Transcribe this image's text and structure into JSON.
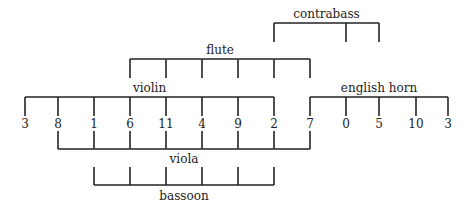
{
  "diagram": {
    "type": "pitch-class row with instrument groupings",
    "row": {
      "numbers": [
        "3",
        "8",
        "1",
        "6",
        "11",
        "4",
        "9",
        "2",
        "7",
        "0",
        "5",
        "10",
        "3"
      ],
      "x": [
        25,
        58,
        94,
        130,
        166,
        202,
        238,
        274,
        310,
        346,
        379,
        416,
        448
      ]
    },
    "groups": [
      {
        "name": "contrabass",
        "label": "contrabass",
        "position": "above",
        "start": 7,
        "end": 9,
        "ticks": [
          7,
          9,
          10
        ],
        "line_y": 23,
        "tick_y": 42,
        "label_y": 18
      },
      {
        "name": "flute",
        "label": "flute",
        "position": "above",
        "start": 3,
        "end": 8,
        "ticks": [
          3,
          4,
          5,
          6,
          7,
          8
        ],
        "line_y": 59,
        "tick_y": 78,
        "label_y": 54
      },
      {
        "name": "violin",
        "label": "violin",
        "position": "above",
        "start": 0,
        "end": 7,
        "ticks": [
          0,
          1,
          2,
          3,
          4,
          5,
          6,
          7
        ],
        "line_y": 97,
        "tick_y": 116,
        "label_y": 92
      },
      {
        "name": "english-horn",
        "label": "english horn",
        "position": "above",
        "start": 8,
        "end": 12,
        "ticks": [
          8,
          9,
          10,
          11,
          12
        ],
        "line_y": 97,
        "tick_y": 116,
        "label_y": 92
      },
      {
        "name": "viola",
        "label": "viola",
        "position": "below",
        "start": 1,
        "end": 8,
        "ticks": [
          1,
          2,
          3,
          4,
          5,
          6,
          7,
          8
        ],
        "line_y": 149,
        "tick_y": 131,
        "label_y": 163
      },
      {
        "name": "bassoon",
        "label": "bassoon",
        "position": "below",
        "start": 2,
        "end": 7,
        "ticks": [
          2,
          3,
          4,
          5,
          6,
          7
        ],
        "line_y": 185,
        "tick_y": 167,
        "label_y": 200
      }
    ]
  }
}
